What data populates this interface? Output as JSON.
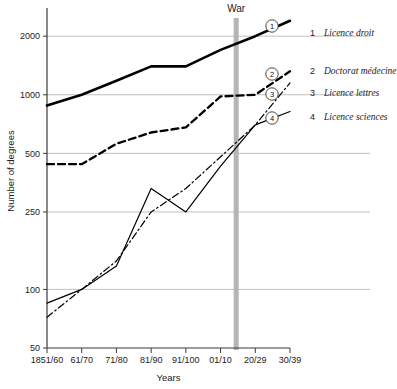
{
  "chart_data": {
    "type": "line",
    "title": "",
    "xlabel": "Years",
    "ylabel": "Number of degrees",
    "yscale": "log",
    "ylim": [
      50,
      2600
    ],
    "grid": true,
    "legend_position": "right",
    "categories": [
      "1851/60",
      "61/70",
      "71/80",
      "81/90",
      "91/100",
      "01/10",
      "20/29",
      "30/39"
    ],
    "ytick_labels": [
      "50",
      "100",
      "250",
      "500",
      "1000",
      "2000"
    ],
    "ytick_values": [
      50,
      100,
      250,
      500,
      1000,
      2000
    ],
    "annotations": [
      {
        "text": "War",
        "x_category_between": "01/10 and 20/29",
        "type": "vertical-band"
      }
    ],
    "series": [
      {
        "name": "Licence droit",
        "marker_number": "1",
        "style": "thick-solid",
        "values": [
          880,
          1000,
          1180,
          1400,
          1400,
          1700,
          2000,
          2400
        ]
      },
      {
        "name": "Doctorat médecine",
        "marker_number": "2",
        "style": "dashed",
        "values": [
          440,
          440,
          560,
          640,
          680,
          980,
          1000,
          1320
        ]
      },
      {
        "name": "Licence lettres",
        "marker_number": "3",
        "style": "dash-dot",
        "values": [
          72,
          100,
          140,
          250,
          330,
          480,
          700,
          1150
        ]
      },
      {
        "name": "Licence sciences",
        "marker_number": "4",
        "style": "thin-solid",
        "values": [
          85,
          100,
          132,
          330,
          250,
          430,
          700,
          820
        ]
      }
    ]
  },
  "legend": {
    "items": [
      {
        "number": "1",
        "label": "Licence droit"
      },
      {
        "number": "2",
        "label": "Doctorat médecine"
      },
      {
        "number": "3",
        "label": "Licence lettres"
      },
      {
        "number": "4",
        "label": "Licence sciences"
      }
    ]
  },
  "colors": {
    "line": "#000000",
    "grid": "#b9b9b9",
    "axis": "#3a3a3a",
    "war_band": "#b5b5b5",
    "background": "#ffffff"
  }
}
